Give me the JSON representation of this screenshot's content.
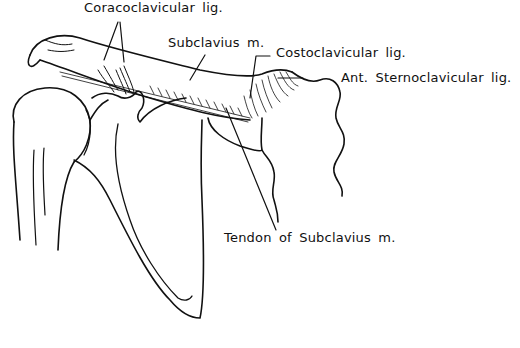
{
  "figure": {
    "labels": {
      "coracoclavicular": "Coracoclavicular lig.",
      "subclavius": "Subclavius m.",
      "costoclavicular": "Costoclavicular lig.",
      "ant_sternoclavicular": "Ant. Sternoclavicular lig.",
      "tendon_subclavius": "Tendon of Subclavius m."
    },
    "colors": {
      "ink": "#111111",
      "background": "#ffffff"
    }
  }
}
